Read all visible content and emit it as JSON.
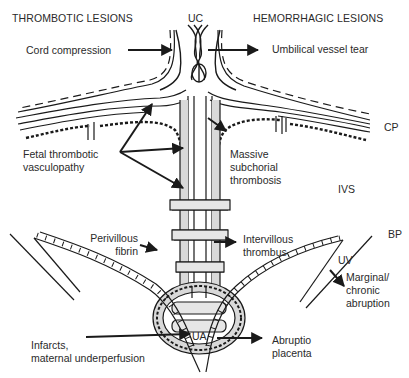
{
  "headers": {
    "left": "THROMBOTIC LESIONS",
    "right": "HEMORRHAGIC LESIONS"
  },
  "anatomy_labels": {
    "uc": "UC",
    "cp": "CP",
    "ivs": "IVS",
    "bp": "BP",
    "uv": "UV",
    "ua": "UA"
  },
  "lesion_labels": {
    "cord_compression": "Cord compression",
    "umbilical_vessel_tear": "Umbilical vessel tear",
    "fetal_thrombotic_vasculopathy": "Fetal thrombotic\nvasculopathy",
    "massive_subchorial_thrombosis": "Massive\nsubchorial\nthrombosis",
    "perivillous_fibrin": "Perivillous\nfibrin",
    "intervillous_thrombus": "Intervillous\nthrombus",
    "marginal_chronic_abruption": "Marginal/\nchronic\nabruption",
    "infarcts_maternal_underperfusion": "Infarcts,\nmaternal underperfusion",
    "abruptio_placenta": "Abruptio\nplacenta"
  },
  "colors": {
    "ink": "#1a1a1a",
    "text": "#2a2a2a",
    "shade": "#d9d9d9",
    "background": "#ffffff"
  }
}
